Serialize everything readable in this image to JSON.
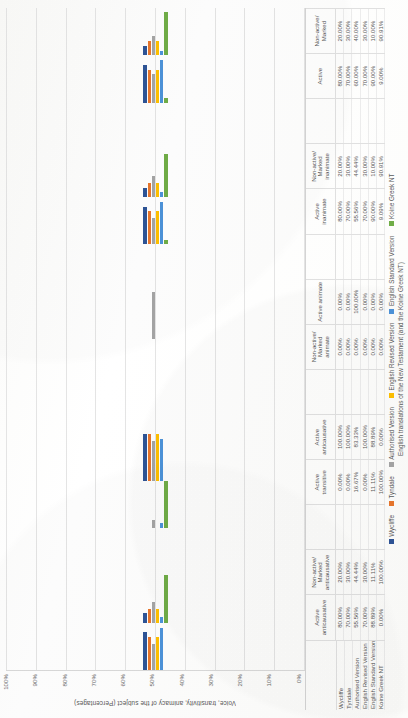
{
  "chart_data": {
    "type": "bar",
    "title": "",
    "xlabel": "English translations of the New Testament (and the Koine Greek NT)",
    "ylabel": "Voice, transitivity, animacy of the subject (Percentages)",
    "ylim": [
      0,
      100
    ],
    "yticks": [
      "100%",
      "90%",
      "80%",
      "70%",
      "60%",
      "50%",
      "40%",
      "30%",
      "20%",
      "10%",
      "0%"
    ],
    "grid": true,
    "legend_position": "bottom",
    "orientation": "rotated-90",
    "categories": [
      "Active anticausative",
      "Non-active/ Marked anticausative",
      "",
      "Active transitive",
      "Active anticausative",
      "",
      "Non-active/ Marked animate",
      "Active animate",
      "",
      "Active inanimate",
      "Non-active/ Marked inanimate",
      "",
      "Active",
      "Non-active/ Marked"
    ],
    "series": [
      {
        "name": "Wycliffe",
        "color": "#2E5496",
        "values": [
          80.0,
          20.0,
          null,
          0.0,
          100.0,
          null,
          0.0,
          0.0,
          null,
          80.0,
          20.0,
          null,
          80.0,
          20.0
        ],
        "labels": [
          "80.00%",
          "20.00%",
          "",
          "0.00%",
          "100.00%",
          "",
          "0.00%",
          "0.00%",
          "",
          "80.00%",
          "20.00%",
          "",
          "80.00%",
          "20.00%"
        ]
      },
      {
        "name": "Tyndale",
        "color": "#E8762C",
        "values": [
          70.0,
          30.0,
          null,
          0.0,
          100.0,
          null,
          0.0,
          0.0,
          null,
          70.0,
          30.0,
          null,
          70.0,
          30.0
        ],
        "labels": [
          "70.00%",
          "30.00%",
          "",
          "0.00%",
          "100.00%",
          "",
          "0.00%",
          "0.00%",
          "",
          "70.00%",
          "30.00%",
          "",
          "70.00%",
          "30.00%"
        ]
      },
      {
        "name": "Authorised Version",
        "color": "#A5A5A5",
        "values": [
          55.56,
          44.44,
          null,
          16.67,
          83.33,
          null,
          0.0,
          100.0,
          null,
          55.56,
          44.44,
          null,
          60.0,
          40.0
        ],
        "labels": [
          "55.56%",
          "44.44%",
          "",
          "16.67%",
          "83.33%",
          "",
          "0.00%",
          "100.00%",
          "",
          "55.56%",
          "44.44%",
          "",
          "60.00%",
          "40.00%"
        ]
      },
      {
        "name": "English Revised Version",
        "color": "#FFC000",
        "values": [
          70.0,
          30.0,
          null,
          0.0,
          100.0,
          null,
          0.0,
          0.0,
          null,
          70.0,
          30.0,
          null,
          70.0,
          30.0
        ],
        "labels": [
          "70.00%",
          "30.00%",
          "",
          "0.00%",
          "100.00%",
          "",
          "0.00%",
          "0.00%",
          "",
          "70.00%",
          "30.00%",
          "",
          "70.00%",
          "30.00%"
        ]
      },
      {
        "name": "English Standard Version",
        "color": "#4D93D9",
        "values": [
          88.89,
          11.11,
          null,
          11.11,
          88.89,
          null,
          0.0,
          0.0,
          null,
          90.0,
          10.0,
          null,
          90.0,
          10.0
        ],
        "labels": [
          "88.89%",
          "11.11%",
          "",
          "11.11%",
          "88.89%",
          "",
          "0.00%",
          "0.00%",
          "",
          "90.00%",
          "10.00%",
          "",
          "90.00%",
          "10.00%"
        ]
      },
      {
        "name": "Koine Greek NT",
        "color": "#70AD47",
        "values": [
          0.0,
          100.0,
          null,
          100.0,
          0.0,
          null,
          0.0,
          0.0,
          null,
          9.09,
          90.91,
          null,
          9.0,
          90.91
        ],
        "labels": [
          "0.00%",
          "100.00%",
          "",
          "100.00%",
          "0.00%",
          "",
          "0.00%",
          "0.00%",
          "",
          "9.09%",
          "90.91%",
          "",
          "9.00%",
          "90.91%"
        ]
      }
    ]
  },
  "axis": {
    "y_title": "Voice, transitivity, animacy of the subject (Percentages)",
    "x_title": "English translations of the New Testament (and the Koine Greek NT)"
  },
  "legend": {
    "items": [
      {
        "label": "Wycliffe",
        "color": "#2E5496"
      },
      {
        "label": "Tyndale",
        "color": "#E8762C"
      },
      {
        "label": "Authorised Version",
        "color": "#A5A5A5"
      },
      {
        "label": "English Revised Version",
        "color": "#FFC000"
      },
      {
        "label": "English Standard Version",
        "color": "#4D93D9"
      },
      {
        "label": "Koine Greek NT",
        "color": "#70AD47"
      }
    ]
  }
}
